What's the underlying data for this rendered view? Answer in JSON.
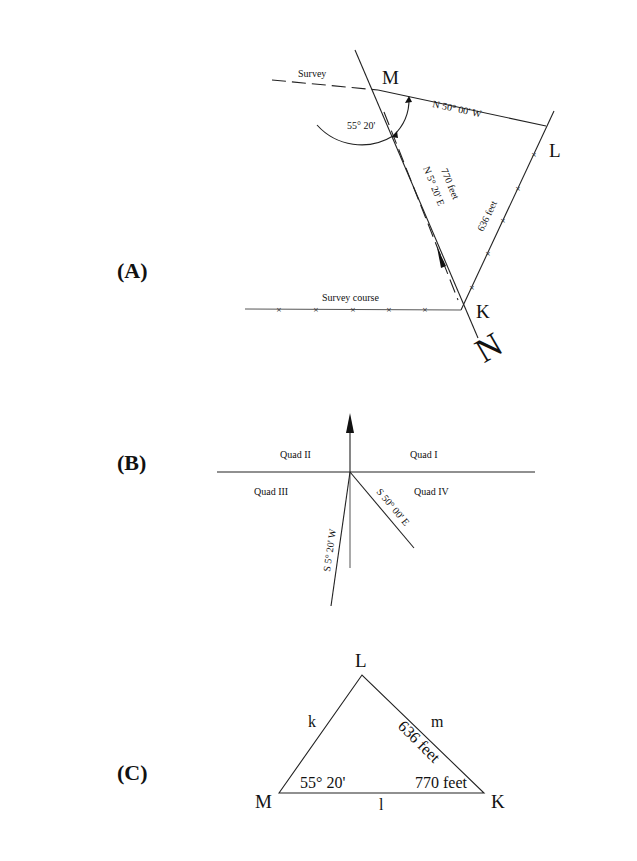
{
  "panels": {
    "A": {
      "label": "(A)",
      "points": {
        "M": "M",
        "L": "L",
        "K": "K"
      },
      "north_label": "N",
      "survey_label": "Survey",
      "survey_course_label": "Survey course",
      "angle_label": "55° 20'",
      "bearing_ML": "N 50° 00' W",
      "bearing_KM": "N 5° 20' E",
      "distance_KM": "770 feet",
      "distance_KL": "636 feet"
    },
    "B": {
      "label": "(B)",
      "quadrants": {
        "q1": "Quad I",
        "q2": "Quad II",
        "q3": "Quad III",
        "q4": "Quad IV"
      },
      "bearing_southwest": "S 5° 20' W",
      "bearing_southeast": "S 50° 00' E"
    },
    "C": {
      "label": "(C)",
      "vertices": {
        "M": "M",
        "L": "L",
        "K": "K"
      },
      "sides": {
        "k": "k",
        "l": "l",
        "m": "m"
      },
      "angle_M": "55° 20'",
      "side_MK_value": "770 feet",
      "side_LK_value": "636 feet"
    }
  }
}
